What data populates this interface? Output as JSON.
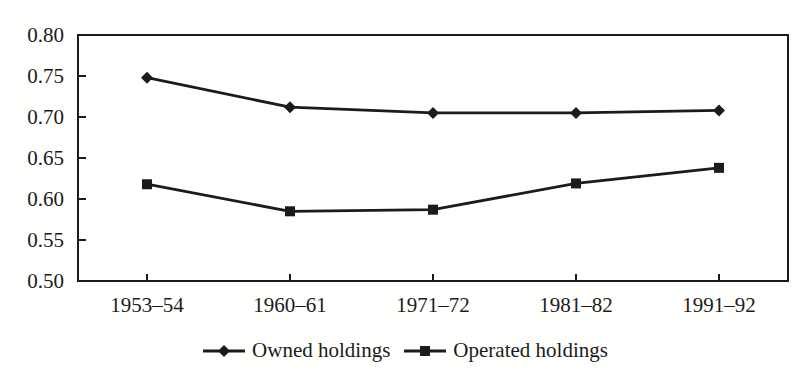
{
  "figure": {
    "background": "#fffffe",
    "ink_color": "#1b1b1b"
  },
  "chart_data": {
    "type": "line",
    "title": "",
    "xlabel": "",
    "ylabel": "",
    "categories": [
      "1953–54",
      "1960–61",
      "1971–72",
      "1981–82",
      "1991–92"
    ],
    "series": [
      {
        "name": "Owned holdings",
        "marker": "diamond",
        "values": [
          0.748,
          0.712,
          0.705,
          0.705,
          0.708
        ]
      },
      {
        "name": "Operated holdings",
        "marker": "square",
        "values": [
          0.618,
          0.585,
          0.587,
          0.619,
          0.638
        ]
      }
    ],
    "ylim": [
      0.5,
      0.8
    ],
    "ytick_step": 0.05,
    "ytick_labels": [
      "0.50",
      "0.55",
      "0.60",
      "0.65",
      "0.70",
      "0.75",
      "0.80"
    ],
    "grid": false,
    "legend_position": "bottom-center",
    "line_color": "#1b1b1b"
  }
}
